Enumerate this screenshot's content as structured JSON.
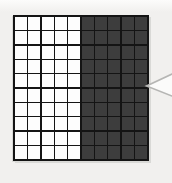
{
  "figure": {
    "grid": {
      "rows": 10,
      "cols": 10,
      "shaded_col_start": 6,
      "shaded_cells": 50,
      "unshaded_cells": 50,
      "total_cells": 100,
      "shaded_fraction": "50/100"
    },
    "callout": {
      "shape": "wedge-pointer",
      "points_to": "shaded-region",
      "direction": "left",
      "tip": [
        146.5,
        86
      ],
      "base_top": [
        172,
        74
      ],
      "base_bottom": [
        172,
        96
      ]
    },
    "colors": {
      "background": "#f1f0ee",
      "background_top": "#fcfcfb",
      "cell_light": "#fdfdfd",
      "cell_dark": "#3d3d3d",
      "grid_line": "#141414",
      "grid_shadow": "#d9d9d6",
      "callout_fill": "#fbfbfa",
      "callout_stroke": "#b6b6b4"
    }
  }
}
